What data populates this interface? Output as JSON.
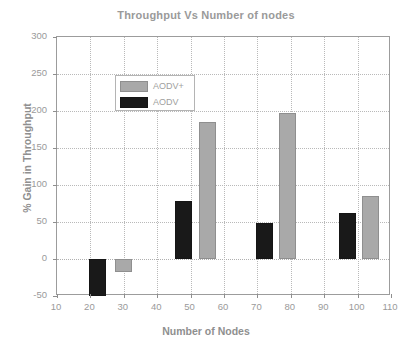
{
  "chart_data": {
    "type": "bar",
    "title": "Throughput Vs Number of nodes",
    "xlabel": "Number of Nodes",
    "ylabel": "% Gain in Throughput",
    "xlim": [
      10,
      110
    ],
    "ylim": [
      -50,
      300
    ],
    "xticks": [
      10,
      20,
      30,
      40,
      50,
      60,
      70,
      80,
      90,
      100,
      110
    ],
    "yticks": [
      -50,
      0,
      50,
      100,
      150,
      200,
      250,
      300
    ],
    "grid": true,
    "legend_position": "top-left",
    "series": [
      {
        "name": "AODV+",
        "color": "#a9a9a9",
        "points": [
          {
            "x": 30,
            "value": -18
          },
          {
            "x": 55,
            "value": 185
          },
          {
            "x": 79,
            "value": 197
          },
          {
            "x": 104,
            "value": 85
          }
        ]
      },
      {
        "name": "AODV",
        "color": "#191919",
        "points": [
          {
            "x": 22,
            "value": -50
          },
          {
            "x": 48,
            "value": 78
          },
          {
            "x": 72,
            "value": 48
          },
          {
            "x": 97,
            "value": 62
          }
        ]
      }
    ]
  },
  "legend": {
    "entries": [
      {
        "label": "AODV+",
        "swatch": "aodvplus"
      },
      {
        "label": "AODV",
        "swatch": "aodv"
      }
    ]
  }
}
